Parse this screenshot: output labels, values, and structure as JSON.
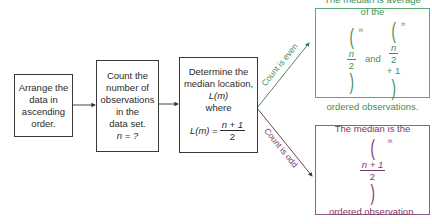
{
  "flow": {
    "step1": [
      "Arrange the",
      "data in",
      "ascending",
      "order."
    ],
    "step2": [
      "Count the",
      "number of",
      "observations",
      "in the",
      "data set."
    ],
    "step2_var": "n = ?",
    "step3": [
      "Determine the",
      "median location,",
      "L(m)",
      "where"
    ],
    "step3_formula": {
      "lhs": "L(m) =",
      "num": "n + 1",
      "den": "2"
    }
  },
  "branches": {
    "even": {
      "label": "Count is even",
      "color": "#3f8f5d",
      "line1": "The median is average",
      "line2": "of the",
      "term1": {
        "num": "n",
        "den": "2",
        "sup": "th"
      },
      "and": "and",
      "term2": {
        "num": "n",
        "den": "2",
        "plus": "+ 1",
        "sup": "th"
      },
      "line3": "ordered observations."
    },
    "odd": {
      "label": "Count is odd",
      "color": "#7a3a68",
      "line1": "The median is the",
      "term": {
        "num": "n + 1",
        "den": "2",
        "sup": "th"
      },
      "line2": "ordered observation."
    }
  }
}
